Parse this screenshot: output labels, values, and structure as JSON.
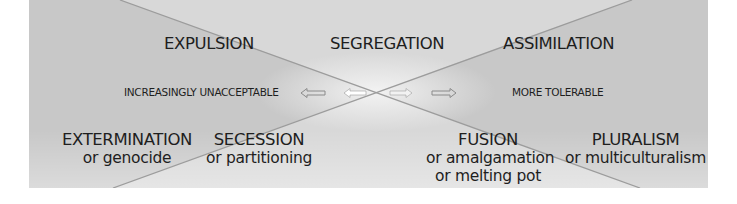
{
  "diagram": {
    "top_row": [
      {
        "label": "EXPULSION"
      },
      {
        "label": "SEGREGATION"
      },
      {
        "label": "ASSIMILATION"
      }
    ],
    "axis": {
      "left_label": "INCREASINGLY UNACCEPTABLE",
      "right_label": "MORE TOLERABLE",
      "arrows": [
        "arrow-left-outline",
        "arrow-left-solid",
        "arrow-right-solid",
        "arrow-right-outline"
      ]
    },
    "bottom_row": [
      {
        "label": "EXTERMINATION",
        "sub": [
          "or genocide"
        ]
      },
      {
        "label": "SECESSION",
        "sub": [
          "or partitioning"
        ]
      },
      {
        "label": "FUSION",
        "sub": [
          "or amalgamation",
          "or melting pot"
        ]
      },
      {
        "label": "PLURALISM",
        "sub": [
          "or multiculturalism"
        ]
      }
    ],
    "colors": {
      "light_wedge": "#d8d8d8",
      "dark_wedge": "#c6c6c6",
      "line": "#9a9a9a",
      "text": "#1e1e1e"
    }
  }
}
